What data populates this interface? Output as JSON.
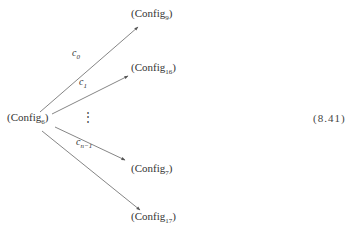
{
  "diagram": {
    "source": {
      "name": "Config",
      "sub": "6"
    },
    "targets": [
      {
        "name": "Config",
        "sub": "9"
      },
      {
        "name": "Config",
        "sub": "16"
      },
      {
        "name": "Config",
        "sub": "7"
      },
      {
        "name": "Config",
        "sub": "17"
      }
    ],
    "edge_labels": [
      {
        "name": "c",
        "sub": "0"
      },
      {
        "name": "c",
        "sub": "1"
      },
      {
        "name": "c",
        "sub": "n−1"
      }
    ],
    "ellipsis": "⋮",
    "open_paren": "(",
    "close_paren": ")"
  },
  "equation_number": "(8.41)",
  "colors": {
    "line": "#555555",
    "text": "#333333"
  }
}
